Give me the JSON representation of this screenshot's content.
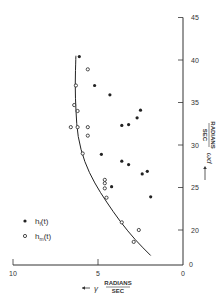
{
  "chart_data": {
    "type": "scatter",
    "title": "",
    "xlabel": "← γ RADIANS/SEC",
    "ylabel": "ω_d → RADIANS/SEC",
    "x_reversed": true,
    "xlim": [
      10,
      0
    ],
    "ylim_axis": [
      0,
      45
    ],
    "y_visible_range": [
      15,
      45
    ],
    "x_ticks": [
      10,
      5,
      0
    ],
    "y_ticks": [
      0,
      20,
      25,
      30,
      35,
      40,
      45
    ],
    "x_tick_labels": [
      "10",
      "5",
      "0"
    ],
    "y_tick_labels": [
      "0",
      "20",
      "25",
      "30",
      "35",
      "40",
      "45"
    ],
    "grid": false,
    "legend_position": "lower-left",
    "series": [
      {
        "name": "h_f(t)",
        "marker": "filled-circle",
        "points": [
          [
            6.1,
            40.4
          ],
          [
            5.2,
            37.0
          ],
          [
            4.3,
            35.9
          ],
          [
            2.5,
            34.1
          ],
          [
            2.7,
            33.2
          ],
          [
            3.6,
            32.3
          ],
          [
            3.2,
            32.4
          ],
          [
            4.8,
            28.9
          ],
          [
            3.6,
            28.1
          ],
          [
            3.2,
            27.7
          ],
          [
            2.4,
            26.6
          ],
          [
            2.1,
            26.9
          ],
          [
            4.2,
            25.1
          ],
          [
            1.9,
            23.9
          ]
        ]
      },
      {
        "name": "h_m(t)",
        "marker": "open-circle",
        "points": [
          [
            5.6,
            38.9
          ],
          [
            6.3,
            37.0
          ],
          [
            6.4,
            34.7
          ],
          [
            6.2,
            34.0
          ],
          [
            6.6,
            32.1
          ],
          [
            6.2,
            32.1
          ],
          [
            5.6,
            32.1
          ],
          [
            5.6,
            31.1
          ],
          [
            5.9,
            29.0
          ],
          [
            4.6,
            25.9
          ],
          [
            4.6,
            25.5
          ],
          [
            4.6,
            24.9
          ],
          [
            4.5,
            23.8
          ],
          [
            3.6,
            20.9
          ],
          [
            2.6,
            20.0
          ],
          [
            2.9,
            18.6
          ]
        ]
      },
      {
        "name": "fitted curve",
        "marker": "line",
        "points": [
          [
            6.3,
            40.5
          ],
          [
            6.35,
            37
          ],
          [
            6.3,
            34
          ],
          [
            6.2,
            31
          ],
          [
            5.8,
            28
          ],
          [
            5.2,
            25.5
          ],
          [
            4.5,
            23.3
          ],
          [
            3.7,
            21
          ],
          [
            2.8,
            18.8
          ],
          [
            1.9,
            17.0
          ]
        ]
      }
    ]
  },
  "axes": {
    "x_label_symbol": "γ",
    "x_label_units_num": "RADIANS",
    "x_label_units_den": "SEC",
    "y_label_symbol": "ωd",
    "y_label_units_num": "RADIANS",
    "y_label_units_den": "SEC"
  },
  "legend": {
    "filled": "hf(t)",
    "open": "hm(t)"
  }
}
